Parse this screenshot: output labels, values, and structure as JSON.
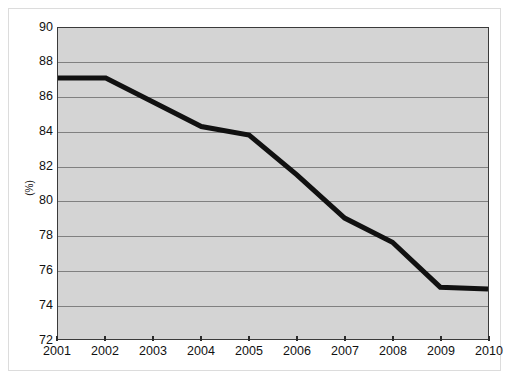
{
  "chart_data": {
    "type": "line",
    "title": "",
    "subtitle": "",
    "xlabel": "",
    "ylabel": "(%)",
    "categories": [
      "2001",
      "2002",
      "2003",
      "2004",
      "2005",
      "2006",
      "2007",
      "2008",
      "2009",
      "2010"
    ],
    "x": [
      2001,
      2002,
      2003,
      2004,
      2005,
      2006,
      2007,
      2008,
      2009,
      2010
    ],
    "values": [
      87.1,
      87.1,
      85.7,
      84.3,
      83.8,
      81.5,
      79.0,
      77.6,
      75.0,
      74.9
    ],
    "series": [
      {
        "name": "",
        "values": [
          87.1,
          87.1,
          85.7,
          84.3,
          83.8,
          81.5,
          79.0,
          77.6,
          75.0,
          74.9
        ]
      }
    ],
    "ylim": [
      72,
      90
    ],
    "xlim": [
      2001,
      2010
    ],
    "ytick_labels": [
      "72",
      "74",
      "76",
      "78",
      "80",
      "82",
      "84",
      "86",
      "88",
      "90"
    ],
    "ytick_values": [
      72,
      74,
      76,
      78,
      80,
      82,
      84,
      86,
      88,
      90
    ],
    "xtick_labels": [
      "2001",
      "2002",
      "2003",
      "2004",
      "2005",
      "2006",
      "2007",
      "2008",
      "2009",
      "2010"
    ],
    "grid": "horizontal",
    "legend": "none",
    "annotations": [],
    "colors": {
      "line": "#111111",
      "plot_background": "#d4d4d4",
      "gridline": "#808080",
      "axis": "#3a3a3a",
      "text": "#111111",
      "figure_background": "#ffffff"
    }
  }
}
